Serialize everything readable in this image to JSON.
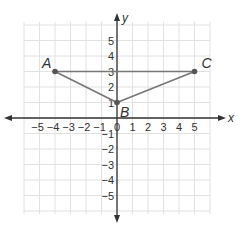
{
  "diagram": {
    "type": "coordinate-plane-triangle",
    "axes": {
      "x_label": "x",
      "y_label": "y",
      "x_ticks": [
        "−5",
        "−4",
        "−3",
        "−2",
        "−1",
        "0",
        "1",
        "2",
        "3",
        "4",
        "5"
      ],
      "y_ticks_positive": [
        "1",
        "2",
        "3",
        "4",
        "5"
      ],
      "y_ticks_negative": [
        "−1",
        "−2",
        "−3",
        "−4",
        "−5"
      ],
      "range": [
        -6,
        6
      ]
    },
    "points": [
      {
        "label": "A",
        "x": -4,
        "y": 3
      },
      {
        "label": "B",
        "x": 0,
        "y": 1
      },
      {
        "label": "C",
        "x": 5,
        "y": 3
      }
    ],
    "segments": [
      [
        "A",
        "B"
      ],
      [
        "B",
        "C"
      ],
      [
        "A",
        "C"
      ]
    ],
    "colors": {
      "grid": "#e2e2e2",
      "axis": "#333333",
      "segment": "#777777",
      "point": "#555555",
      "text": "#333333"
    }
  }
}
